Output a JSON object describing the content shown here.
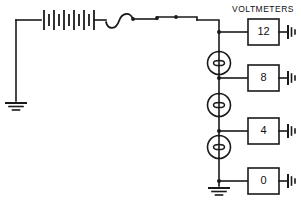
{
  "diagram": {
    "title": "VOLTMETERS",
    "type": "electrical-circuit-schematic",
    "stroke_color": "#1a1a1a",
    "background_color": "#ffffff",
    "components": {
      "battery": {
        "name": "battery",
        "cells": 6
      },
      "wire_loop": {
        "name": "wire-loop"
      },
      "sources": [
        {
          "name": "generator-1"
        },
        {
          "name": "generator-2"
        },
        {
          "name": "generator-3"
        }
      ],
      "grounds": [
        {
          "name": "ground-left"
        },
        {
          "name": "ground-bottom"
        }
      ]
    },
    "meters": [
      {
        "label": "12",
        "ground": "ground-meter-12"
      },
      {
        "label": "8",
        "ground": "ground-meter-8"
      },
      {
        "label": "4",
        "ground": "ground-meter-4"
      },
      {
        "label": "0",
        "ground": "ground-meter-0"
      }
    ]
  }
}
